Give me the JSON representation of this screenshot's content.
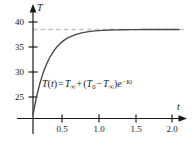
{
  "figure": {
    "kind": "cartesian-plot",
    "background_color": "#ffffff"
  },
  "axes": {
    "x_axis_label": "t",
    "y_axis_label": "T",
    "x_ticks": [
      "0.5",
      "1.0",
      "1.5",
      "2.0"
    ],
    "y_ticks": [
      "40",
      "35",
      "30",
      "25"
    ],
    "axis_color": "#1a1a1a",
    "has_arrowheads": true
  },
  "annotation": {
    "equation_plain": "T(t) = T∞ + (T0 − T∞)e^(−Kt)",
    "lhs_function": "T",
    "lhs_variable": "t",
    "equals": "=",
    "term_ambient": "T",
    "subscript_infinity": "∞",
    "plus": "+",
    "open_paren": "(",
    "term_initial": "T",
    "subscript_zero": "0",
    "minus": "−",
    "close_paren": ")",
    "exp_base": "e",
    "exp_minus": "−",
    "exp_rate": "K",
    "exp_variable": "t",
    "color": "#1a1a1a"
  },
  "asymptote": {
    "label": "",
    "value": 38.5,
    "style": "dashed",
    "color": "#c2c2c2"
  },
  "curve": {
    "color": "#4a4a4a",
    "width": 1.4
  },
  "chart_data": {
    "type": "line",
    "title": "",
    "subtitle": "",
    "xlabel": "t",
    "ylabel": "T",
    "xlim": [
      0,
      2.15
    ],
    "ylim": [
      21.5,
      41.5
    ],
    "xticks": [
      0.5,
      1.0,
      1.5,
      2.0
    ],
    "xticklabels": [
      "0.5",
      "1.0",
      "1.5",
      "2.0"
    ],
    "yticks": [
      25,
      30,
      35,
      40
    ],
    "yticklabels": [
      "25",
      "30",
      "35",
      "40"
    ],
    "grid": false,
    "legend": null,
    "annotations": [
      {
        "text": "T(t) = T∞ + (T0 − T∞)e^(−Kt)",
        "x": 0.25,
        "y": 28.0
      }
    ],
    "reference_lines": [
      {
        "orientation": "horizontal",
        "y": 38.5,
        "style": "dashed",
        "color": "#c2c2c2",
        "label": "T∞ asymptote"
      }
    ],
    "series": [
      {
        "name": "T(t) = T∞ + (T0 − T∞)e^(−Kt)",
        "model": "exponential-approach",
        "params": {
          "T_inf": 38.5,
          "T_0": 21.5,
          "K": 4.6
        },
        "x": [
          0.0,
          0.05,
          0.1,
          0.15,
          0.2,
          0.25,
          0.3,
          0.35,
          0.4,
          0.45,
          0.5,
          0.6,
          0.7,
          0.8,
          0.9,
          1.0,
          1.1,
          1.2,
          1.3,
          1.4,
          1.5,
          1.6,
          1.7,
          1.8,
          1.9,
          2.0,
          2.1
        ],
        "y": [
          21.5,
          25.0,
          27.78,
          29.99,
          31.74,
          33.14,
          34.24,
          35.12,
          35.82,
          36.37,
          36.81,
          37.43,
          37.82,
          38.07,
          38.23,
          38.33,
          38.39,
          38.43,
          38.46,
          38.47,
          38.48,
          38.49,
          38.49,
          38.5,
          38.5,
          38.5,
          38.5
        ]
      }
    ]
  }
}
